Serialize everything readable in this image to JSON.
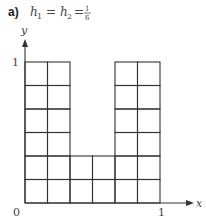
{
  "title": {
    "label": "a)",
    "h1_symbol": "h",
    "h1_sub": "1",
    "equals": "=",
    "h2_symbol": "h",
    "h2_sub": "2",
    "frac_num": "1",
    "frac_den": "6"
  },
  "axes": {
    "x_label": "x",
    "y_label": "y",
    "origin_label": "0",
    "x_tick_label": "1",
    "y_tick_label": "1",
    "range": [
      0,
      1
    ]
  },
  "grid": {
    "step_h": "1/6",
    "cols": 6,
    "rows": 6,
    "cells_description": "U-shaped region: columns 1,2,5,6 span all 6 rows; columns 3,4 span only the bottom 2 rows",
    "column_heights": [
      6,
      6,
      2,
      2,
      6,
      6
    ]
  },
  "colors": {
    "line": "#333333",
    "text": "#444444"
  }
}
